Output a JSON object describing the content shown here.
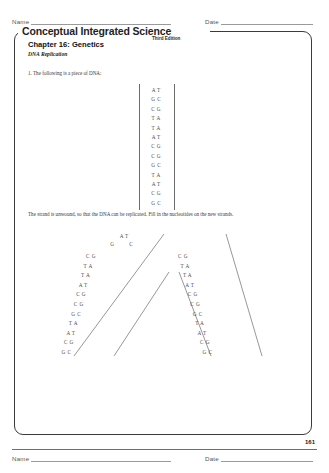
{
  "header": {
    "name_label": "Name",
    "date_label": "Date"
  },
  "footer": {
    "name_label": "Name",
    "date_label": "Date",
    "page_number": "161"
  },
  "book": {
    "title": "Conceptual Integrated Science",
    "edition": "Third Edition"
  },
  "worksheet": {
    "chapter": "Chapter 16:  Genetics",
    "subtitle": "DNA Replication",
    "question_1": "1. The following is a piece of DNA:",
    "question_2": "The strand is unwound, so that the DNA can be replicated. Fill in the nucleotides on the new strands."
  },
  "figure_1": {
    "caption": "double-stranded DNA ladder",
    "pairs": [
      "AT",
      "GC",
      "CG",
      "TA",
      "TA",
      "AT",
      "CG",
      "CG",
      "GC",
      "TA",
      "AT",
      "CG",
      "GC"
    ]
  },
  "figure_2": {
    "caption": "replication fork",
    "top_pairs": [
      "AT",
      "G C"
    ],
    "left_arm": [
      "CG",
      "TA",
      "TA",
      "AT",
      "CG",
      "CG",
      "GC",
      "TA",
      "AT",
      "CG",
      "GC"
    ],
    "right_arm": [
      "CG",
      "TA",
      "TA",
      "AT",
      "CG",
      "CG",
      "GC",
      "TA",
      "AT",
      "CG",
      "GC"
    ]
  },
  "colors": {
    "ink": "#2b2b2b",
    "rule": "#9a9a9a",
    "box_border": "#3b3b3b",
    "figure_ink": "#4a4a4a"
  }
}
